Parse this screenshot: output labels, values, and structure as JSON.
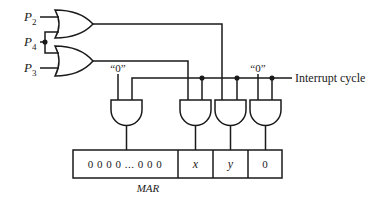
{
  "inputs": [
    {
      "name": "P",
      "sub": "2"
    },
    {
      "name": "P",
      "sub": "4"
    },
    {
      "name": "P",
      "sub": "3"
    }
  ],
  "constant_left": "“0”",
  "constant_right": "“0”",
  "interrupt_label": "Interrupt cycle",
  "register": {
    "label": "MAR",
    "cells": [
      "0 0 0 0 ... 0 0 0",
      "x",
      "y",
      "0"
    ]
  },
  "colors": {
    "line": "#1a1a1a",
    "background": "#ffffff"
  }
}
